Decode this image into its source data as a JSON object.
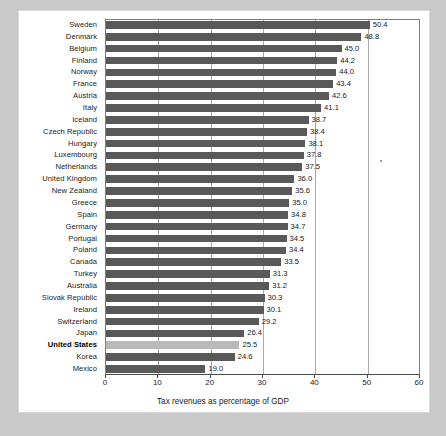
{
  "chart_data": {
    "type": "bar",
    "orientation": "horizontal",
    "title": "",
    "xlabel": "Tax revenues as percentage of GDP",
    "ylabel": "",
    "xlim": [
      0,
      60
    ],
    "xticks": [
      0,
      10,
      20,
      30,
      40,
      50,
      60
    ],
    "xtick_labels": [
      "0",
      "10",
      "20",
      "30",
      "40",
      "50",
      "60"
    ],
    "grid": "vertical",
    "legend": "none",
    "bar_color": "#595959",
    "highlight_color": "#b9b9b9",
    "highlight_category": "United States",
    "categories": [
      "Sweden",
      "Denmark",
      "Belgium",
      "Finland",
      "Norway",
      "France",
      "Austria",
      "Italy",
      "Iceland",
      "Czech Republic",
      "Hungary",
      "Luxembourg",
      "Netherlands",
      "United Kingdom",
      "New Zealand",
      "Greece",
      "Spain",
      "Germany",
      "Portugal",
      "Poland",
      "Canada",
      "Turkey",
      "Australia",
      "Slovak Republic",
      "Ireland",
      "Switzerland",
      "Japan",
      "United States",
      "Korea",
      "Mexico"
    ],
    "values": [
      50.4,
      48.8,
      45.0,
      44.2,
      44.0,
      43.4,
      42.6,
      41.1,
      38.7,
      38.4,
      38.1,
      37.8,
      37.5,
      36.0,
      35.6,
      35.0,
      34.8,
      34.7,
      34.5,
      34.4,
      33.5,
      31.3,
      31.2,
      30.3,
      30.1,
      29.2,
      26.4,
      25.5,
      24.6,
      19.0
    ],
    "value_labels": [
      "50.4",
      "48.8",
      "45.0",
      "44.2",
      "44.0",
      "43.4",
      "42.6",
      "41.1",
      "38.7",
      "38.4",
      "38.1",
      "37.8",
      "37.5",
      "36.0",
      "35.6",
      "35.0",
      "34.8",
      "34.7",
      "34.5",
      "34.4",
      "33.5",
      "31.3",
      "31.2",
      "30.3",
      "30.1",
      "29.2",
      "26.4",
      "25.5",
      "24.6",
      "19.0"
    ]
  }
}
